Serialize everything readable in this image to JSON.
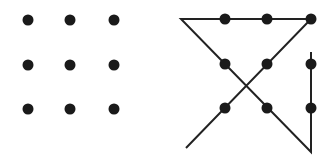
{
  "diagram": {
    "colors": {
      "dot": "#1a1a1a",
      "line": "#222222",
      "background": "#ffffff"
    },
    "left_panel": {
      "label": "unsolved",
      "dots": [
        [
          28,
          20
        ],
        [
          70,
          20
        ],
        [
          114,
          20
        ],
        [
          28,
          65
        ],
        [
          70,
          65
        ],
        [
          114,
          65
        ],
        [
          28,
          109
        ],
        [
          70,
          109
        ],
        [
          114,
          109
        ]
      ]
    },
    "right_panel": {
      "label": "solution",
      "dots": [
        [
          225,
          19
        ],
        [
          267,
          19
        ],
        [
          311,
          19
        ],
        [
          225,
          64
        ],
        [
          267,
          64
        ],
        [
          311,
          64
        ],
        [
          225,
          108
        ],
        [
          267,
          108
        ],
        [
          311,
          108
        ]
      ],
      "path": [
        [
          311,
          52
        ],
        [
          311,
          152
        ],
        [
          181,
          19
        ],
        [
          311,
          19
        ],
        [
          186,
          148
        ]
      ]
    }
  }
}
